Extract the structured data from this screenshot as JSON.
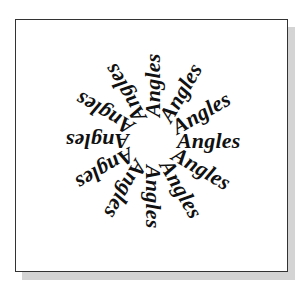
{
  "figure": {
    "word": "Angles",
    "spoke_count": 12,
    "angle_step_deg": 30,
    "angles_deg": [
      -90,
      -60,
      -30,
      0,
      30,
      60,
      90,
      120,
      150,
      180,
      210,
      240
    ],
    "labels": [
      "Angles",
      "Angles",
      "Angles",
      "Angles",
      "Angles",
      "Angles",
      "Angles",
      "Angles",
      "Angles",
      "Angles",
      "Angles",
      "Angles"
    ],
    "text_color": "#111111",
    "frame_border_color": "#333333",
    "shadow_color": "#d4d4d4",
    "background_color": "#ffffff"
  }
}
